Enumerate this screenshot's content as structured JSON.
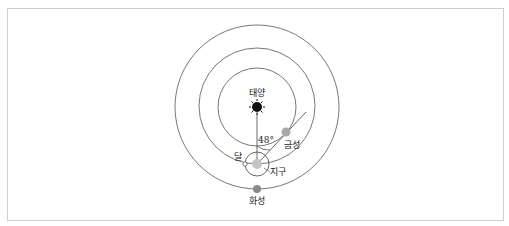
{
  "diagram": {
    "labels": {
      "sun": "태양",
      "venus": "금성",
      "moon": "달",
      "earth": "지구",
      "mars": "화성",
      "angle": "48°"
    },
    "colors": {
      "orbit": "#555555",
      "venus": "#a8a8a8",
      "mars": "#8a8a8a",
      "earth": "#c4c4c4",
      "sun": "#111111"
    }
  }
}
